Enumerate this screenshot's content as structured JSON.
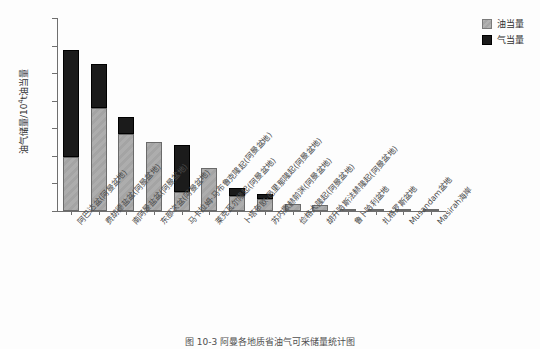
{
  "chart_data": {
    "type": "bar",
    "subtype": "stacked-bar",
    "title": "",
    "caption": "图 10-3  阿曼各地质省油气可采储量统计图",
    "xlabel": "",
    "ylabel": "油气储量/10⁴t油当量",
    "ylabel_parts": {
      "prefix": "油气储量/10",
      "sup": "4",
      "suffix": "t油当量"
    },
    "ylim": [
      0,
      140000
    ],
    "ytick_values": [
      0,
      20000,
      40000,
      60000,
      80000,
      100000,
      120000,
      140000
    ],
    "ytick_labels": [
      "0",
      "20000",
      "40000",
      "60000",
      "80000",
      "100000",
      "120000",
      "140000"
    ],
    "grid": false,
    "legend_position": "top-right",
    "legend": [
      "油当量",
      "气当量"
    ],
    "categories": [
      "阿巴达盆(阿曼盆地)",
      "费胡德盐盆(阿曼盆地)",
      "南阿曼盐盆(阿曼盆地)",
      "东部次盆(阿曼盆地)",
      "马卡拉姆·马布鲁克隆起(阿曼盆地)",
      "莱克瓦尔隆起(阿曼盆地)",
      "卜塔布欧-邑里那隆起(阿曼盆地)",
      "苏内撒赫前渊(阿曼盆地)",
      "俭格大隆起(阿曼盆地)",
      "胡升哈斯法赫隆起(阿曼盆地)",
      "鲁卜哈利盆地",
      "扎格罗斯盆地",
      "Musandam盆地",
      "Masirah海岸"
    ],
    "series": [
      {
        "name": "油当量",
        "color": "#adadad",
        "values": [
          39000,
          75000,
          56000,
          50000,
          14000,
          31000,
          11000,
          8500,
          4800,
          4300,
          1400,
          1300,
          400,
          300
        ]
      },
      {
        "name": "气当量",
        "color": "#1b1b1b",
        "values": [
          78000,
          32000,
          12000,
          0,
          34000,
          0,
          5500,
          3500,
          0,
          0,
          0,
          0,
          0,
          0
        ]
      }
    ],
    "totals": [
      117000,
      107000,
      68000,
      50000,
      48000,
      31000,
      16500,
      12000,
      4800,
      4300,
      1400,
      1300,
      400,
      300
    ]
  },
  "legend": {
    "items": [
      {
        "label": "油当量",
        "swatch": "oil-swatch"
      },
      {
        "label": "气当量",
        "swatch": "gas-swatch"
      }
    ]
  },
  "caption": {
    "text": "图 10-3  阿曼各地质省油气可采储量统计图"
  }
}
